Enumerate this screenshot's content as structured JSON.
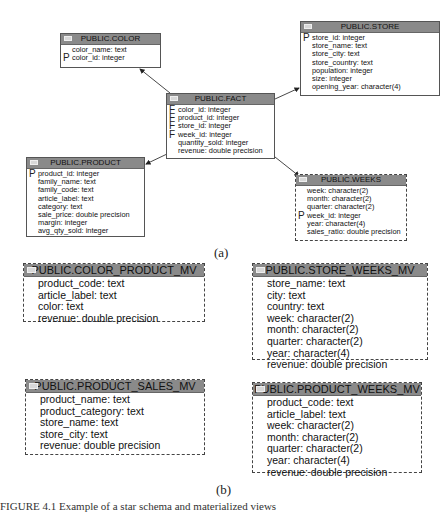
{
  "part_a": {
    "label": "(a)",
    "tables": {
      "color": {
        "title": "PUBLIC.COLOR",
        "columns": [
          {
            "key": "",
            "text": "color_name: text"
          },
          {
            "key": "P",
            "text": "color_id: integer"
          }
        ]
      },
      "store": {
        "title": "PUBLIC.STORE",
        "columns": [
          {
            "key": "P",
            "text": "store_id: integer"
          },
          {
            "key": "",
            "text": "store_name: text"
          },
          {
            "key": "",
            "text": "store_city: text"
          },
          {
            "key": "",
            "text": "store_country: text"
          },
          {
            "key": "",
            "text": "population: integer"
          },
          {
            "key": "",
            "text": "size: integer"
          },
          {
            "key": "",
            "text": "opening_year: character(4)"
          }
        ]
      },
      "fact": {
        "title": "PUBLIC.FACT",
        "columns": [
          {
            "key": "F",
            "text": "color_id: integer"
          },
          {
            "key": "F",
            "text": "product_id: integer"
          },
          {
            "key": "F",
            "text": "store_id: integer"
          },
          {
            "key": "F",
            "text": "week_id: integer"
          },
          {
            "key": "",
            "text": "quantity_sold: integer"
          },
          {
            "key": "",
            "text": "revenue: double precision"
          }
        ]
      },
      "product": {
        "title": "PUBLIC.PRODUCT",
        "columns": [
          {
            "key": "P",
            "text": "product_id: integer"
          },
          {
            "key": "",
            "text": "family_name: text"
          },
          {
            "key": "",
            "text": "family_code: text"
          },
          {
            "key": "",
            "text": "article_label: text"
          },
          {
            "key": "",
            "text": "category: text"
          },
          {
            "key": "",
            "text": "sale_price: double precision"
          },
          {
            "key": "",
            "text": "margin: integer"
          },
          {
            "key": "",
            "text": "avg_qty_sold: integer"
          }
        ]
      },
      "weeks": {
        "title": "PUBLIC.WEEKS",
        "columns": [
          {
            "key": "",
            "text": "week: character(2)"
          },
          {
            "key": "",
            "text": "month: character(2)"
          },
          {
            "key": "",
            "text": "quarter: character(2)"
          },
          {
            "key": "P",
            "text": "week_id: integer"
          },
          {
            "key": "",
            "text": "year: character(4)"
          },
          {
            "key": "",
            "text": "sales_ratio: double precision"
          }
        ]
      }
    },
    "relations": [
      {
        "from": "PUBLIC.FACT",
        "to": "PUBLIC.COLOR"
      },
      {
        "from": "PUBLIC.FACT",
        "to": "PUBLIC.STORE"
      },
      {
        "from": "PUBLIC.FACT",
        "to": "PUBLIC.PRODUCT"
      },
      {
        "from": "PUBLIC.FACT",
        "to": "PUBLIC.WEEKS"
      }
    ]
  },
  "part_b": {
    "label": "(b)",
    "views": {
      "color_product_mv": {
        "title": "PUBLIC.COLOR_PRODUCT_MV",
        "columns": [
          "product_code: text",
          "article_label: text",
          "color: text",
          "revenue: double precision"
        ]
      },
      "store_weeks_mv": {
        "title": "PUBLIC.STORE_WEEKS_MV",
        "columns": [
          "store_name: text",
          "city: text",
          "country: text",
          "week: character(2)",
          "month: character(2)",
          "quarter: character(2)",
          "year: character(4)",
          "revenue: double precision"
        ]
      },
      "product_sales_mv": {
        "title": "PUBLIC.PRODUCT_SALES_MV",
        "columns": [
          "product_name: text",
          "product_category: text",
          "store_name: text",
          "store_city: text",
          "revenue: double precision"
        ]
      },
      "product_weeks_mv": {
        "title": "PUBLIC.PRODUCT_WEEKS_MV",
        "columns": [
          "product_code: text",
          "article_label: text",
          "week: character(2)",
          "month: character(2)",
          "quarter: character(2)",
          "year: character(4)",
          "revenue: double precision"
        ]
      }
    }
  },
  "caption": "FIGURE 4.1 Example of a star schema and materialized views"
}
